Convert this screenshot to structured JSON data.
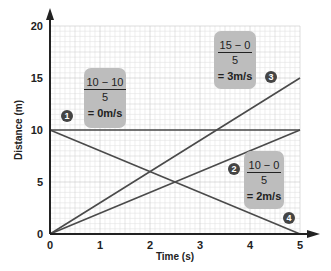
{
  "chart_data": {
    "type": "line",
    "title": "",
    "xlabel": "Time (s)",
    "ylabel": "Distance (m)",
    "xlim": [
      0,
      5
    ],
    "ylim": [
      0,
      20
    ],
    "x_ticks": [
      "0",
      "1",
      "2",
      "3",
      "4",
      "5"
    ],
    "y_ticks": [
      "0",
      "5",
      "10",
      "15",
      "20"
    ],
    "grid": true,
    "series": [
      {
        "name": "1",
        "x": [
          0,
          5
        ],
        "y": [
          10,
          10
        ],
        "speed": "0m/s"
      },
      {
        "name": "2",
        "x": [
          0,
          5
        ],
        "y": [
          0,
          10
        ],
        "speed": "2m/s"
      },
      {
        "name": "3",
        "x": [
          0,
          5
        ],
        "y": [
          0,
          15
        ],
        "speed": "3m/s"
      },
      {
        "name": "4",
        "x": [
          0,
          5
        ],
        "y": [
          10,
          0
        ]
      }
    ],
    "annotations": [
      {
        "numerator": "10 − 10",
        "denominator": "5",
        "result": "= 0m/s"
      },
      {
        "numerator": "15 − 0",
        "denominator": "5",
        "result": "= 3m/s"
      },
      {
        "numerator": "10 − 0",
        "denominator": "5",
        "result": "= 2m/s"
      }
    ]
  },
  "labels": {
    "x_axis": "Time (s)",
    "y_axis": "Distance (m)",
    "markers": [
      "1",
      "2",
      "3",
      "4"
    ]
  },
  "boxes": {
    "b1": {
      "num": "10 − 10",
      "den": "5",
      "res": "= 0m/s"
    },
    "b3": {
      "num": "15 − 0",
      "den": "5",
      "res": "= 3m/s"
    },
    "b2": {
      "num": "10 − 0",
      "den": "5",
      "res": "= 2m/s"
    }
  },
  "colors": {
    "line": "#4a4a4a",
    "grid_minor": "#e2e2e2",
    "grid_major": "#c8c8c8",
    "box": "#bdbdbd"
  }
}
